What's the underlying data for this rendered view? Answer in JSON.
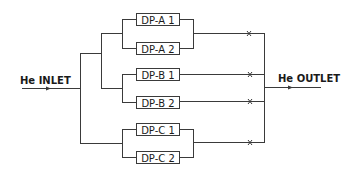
{
  "diagram": {
    "inlet_label": "He INLET",
    "outlet_label": "He OUTLET",
    "groups": [
      {
        "id": "A",
        "pumps": [
          {
            "label": "DP-A 1"
          },
          {
            "label": "DP-A 2"
          }
        ],
        "valve": "x-mark"
      },
      {
        "id": "B",
        "pumps": [
          {
            "label": "DP-B 1"
          },
          {
            "label": "DP-B 2"
          }
        ],
        "valves": [
          "x-mark",
          "x-mark"
        ]
      },
      {
        "id": "C",
        "pumps": [
          {
            "label": "DP-C 1"
          },
          {
            "label": "DP-C 2"
          }
        ],
        "valve": "x-mark"
      }
    ],
    "colors": {
      "line": "#3a3a3a",
      "text": "#1a1a1a",
      "background": "#ffffff"
    }
  }
}
